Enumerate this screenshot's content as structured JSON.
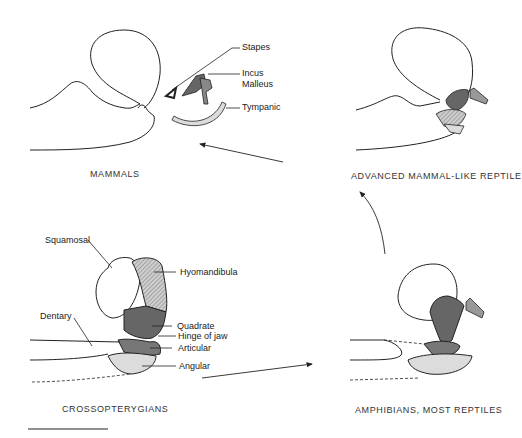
{
  "panels": {
    "mammals": {
      "caption": "MAMMALS",
      "labels": {
        "stapes": "Stapes",
        "incus": "Incus",
        "malleus": "Malleus",
        "tympanic": "Tympanic"
      }
    },
    "advanced": {
      "caption": "ADVANCED MAMMAL-LIKE REPTILE"
    },
    "crossopterygians": {
      "caption": "CROSSOPTERYGIANS",
      "labels": {
        "squamosal": "Squamosal",
        "hyomandibula": "Hyomandibula",
        "dentary": "Dentary",
        "quadrate": "Quadrate",
        "hinge": "Hinge of jaw",
        "articular": "Articular",
        "angular": "Angular"
      }
    },
    "amphibians": {
      "caption": "AMPHIBIANS, MOST REPTILES"
    }
  },
  "colors": {
    "dark": "#555555",
    "medium": "#8a8a8a",
    "light": "#d9d9d9",
    "line": "#222222"
  }
}
